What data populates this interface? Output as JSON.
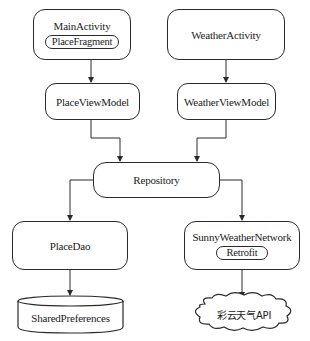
{
  "diagram": {
    "type": "architecture",
    "nodes": {
      "main_activity": {
        "label": "MainActivity",
        "child": "PlaceFragment"
      },
      "weather_activity": {
        "label": "WeatherActivity"
      },
      "place_view_model": {
        "label": "PlaceViewModel"
      },
      "weather_view_model": {
        "label": "WeatherViewModel"
      },
      "repository": {
        "label": "Repository"
      },
      "place_dao": {
        "label": "PlaceDao"
      },
      "network": {
        "label": "SunnyWeatherNetwork",
        "child": "Retrofit"
      },
      "shared_preferences": {
        "label": "SharedPreferences",
        "shape": "cylinder"
      },
      "caiyun_api": {
        "label": "彩云天气API",
        "shape": "cloud"
      }
    },
    "edges": [
      {
        "from": "PlaceFragment",
        "to": "PlaceViewModel"
      },
      {
        "from": "WeatherActivity",
        "to": "WeatherViewModel"
      },
      {
        "from": "PlaceViewModel",
        "to": "Repository"
      },
      {
        "from": "WeatherViewModel",
        "to": "Repository"
      },
      {
        "from": "Repository",
        "to": "PlaceDao"
      },
      {
        "from": "Repository",
        "to": "SunnyWeatherNetwork"
      },
      {
        "from": "PlaceDao",
        "to": "SharedPreferences"
      },
      {
        "from": "SunnyWeatherNetwork",
        "to": "彩云天气API"
      }
    ],
    "colors": {
      "stroke": "#2a2a2a",
      "background": "#ffffff"
    }
  }
}
